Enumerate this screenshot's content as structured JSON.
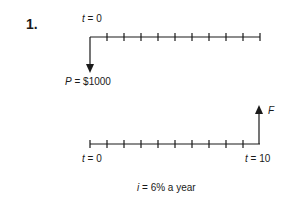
{
  "problem_number": "1.",
  "top_timeline": {
    "start_label_var": "t",
    "start_label_eq": " = 0",
    "periods": 10,
    "cash_flow": {
      "direction": "down",
      "label_var": "P",
      "label_eq": " = $1000"
    }
  },
  "bottom_timeline": {
    "start_label_var": "t",
    "start_label_eq": " = 0",
    "end_label_var": "t",
    "end_label_eq": " = 10",
    "periods": 10,
    "cash_flow": {
      "direction": "up",
      "label": "F"
    }
  },
  "interest": {
    "var": "i",
    "eq": " = 6% a year"
  },
  "colors": {
    "ink": "#1a1a1a",
    "background": "#ffffff"
  }
}
